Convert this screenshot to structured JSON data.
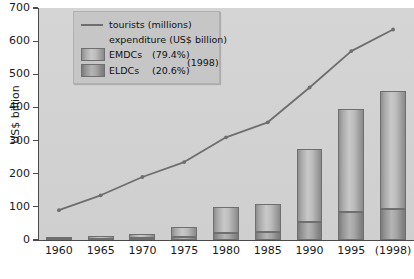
{
  "axes": {
    "y_title": "US$ billion",
    "y_ticks": [
      0,
      100,
      200,
      300,
      400,
      500,
      600,
      700
    ],
    "x_ticks": [
      "1960",
      "1965",
      "1970",
      "1975",
      "1980",
      "1985",
      "1990",
      "1995",
      "(1998)"
    ]
  },
  "legend": {
    "line_label": "tourists (millions)",
    "expenditure_title": "expenditure (US$ billion)",
    "emdcs_label": "EMDCs",
    "emdcs_pct": "(79.4%)",
    "eldcs_label": "ELDCs",
    "eldcs_pct": "(20.6%)",
    "year_note": "(1998)"
  },
  "colors": {
    "plot_background": "#d2d2d2",
    "legend_background": "#c6c6c6",
    "line_color": "#6e6e6e",
    "bar_outline": "#6f6f6f",
    "emdc_fill": "#bdbdbd",
    "eldc_fill": "#a6a6a6",
    "axis_color": "#4a4a4a",
    "text_color": "#1a1a1a"
  },
  "chart_data": {
    "type": "bar",
    "title": "",
    "subtitle": "",
    "xlabel": "",
    "ylabel": "US$ billion",
    "ylim": [
      0,
      700
    ],
    "grid": false,
    "legend_position": "top-left",
    "categories": [
      "1960",
      "1965",
      "1970",
      "1975",
      "1980",
      "1985",
      "1990",
      "1995",
      "(1998)"
    ],
    "stacked": true,
    "series": [
      {
        "name": "ELDCs (20.6%)",
        "type": "bar",
        "unit": "US$ billion",
        "values": [
          2,
          3,
          5,
          10,
          22,
          24,
          55,
          85,
          93
        ]
      },
      {
        "name": "EMDCs (79.4%)",
        "type": "bar",
        "unit": "US$ billion",
        "values": [
          5,
          9,
          13,
          30,
          78,
          86,
          220,
          310,
          357
        ]
      },
      {
        "name": "tourists (millions)",
        "type": "line",
        "unit": "millions",
        "values": [
          90,
          135,
          190,
          235,
          310,
          355,
          460,
          570,
          635
        ]
      }
    ],
    "bar_totals": [
      7,
      12,
      18,
      40,
      100,
      110,
      275,
      395,
      450
    ],
    "annotations": [
      "(1998)"
    ]
  }
}
